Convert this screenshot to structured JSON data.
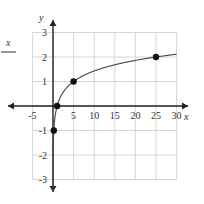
{
  "chart_data": {
    "type": "line",
    "title": "",
    "function": "y = log5(x)",
    "xlabel": "x",
    "ylabel": "y",
    "xlim": [
      -5,
      30
    ],
    "ylim": [
      -3,
      3
    ],
    "grid": true,
    "x_ticks": [
      "-5",
      "5",
      "10",
      "15",
      "20",
      "25",
      "30"
    ],
    "y_ticks": [
      "3",
      "2",
      "1",
      "-1",
      "-2",
      "-3"
    ],
    "points": [
      {
        "x": 0.2,
        "y": -1
      },
      {
        "x": 1,
        "y": 0
      },
      {
        "x": 5,
        "y": 1
      },
      {
        "x": 25,
        "y": 2
      }
    ]
  },
  "fragment": {
    "text": "x"
  }
}
